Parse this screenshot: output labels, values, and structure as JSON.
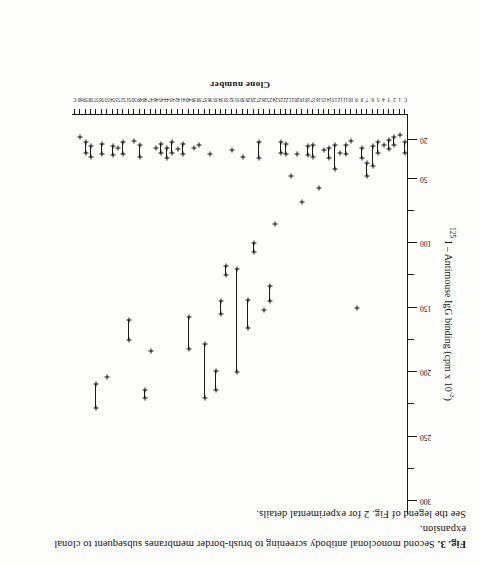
{
  "caption": {
    "fig_number": "Fig. 3.",
    "line1": " Second monoclonal antibody screening to brush-border membranes subsequent to clonal expansion.",
    "line2": "See the legend of Fig. 2 for experimental details."
  },
  "chart_data": {
    "type": "scatter",
    "title": "",
    "xlabel": "Clone  number",
    "ylabel": "125 I – Antimouse IgG binding (cpm x 10-2)",
    "ylabel_prefix": "125",
    "ylabel_main": " I – Antimouse  IgG   binding  (cpm x 10",
    "ylabel_exponent": "-2",
    "ylabel_suffix": ")",
    "ylim": [
      0,
      310
    ],
    "ytick_values": [
      20,
      50,
      100,
      150,
      200,
      250,
      300
    ],
    "ytick_labels": [
      "20",
      "50",
      "100",
      "150",
      "200",
      "250",
      "300"
    ],
    "yminor_values": [
      75,
      125,
      175,
      225,
      275
    ],
    "grid": false,
    "legend": null,
    "xlim": [
      0,
      62
    ],
    "xtick_labels": [
      "C",
      "1",
      "2",
      "3",
      "4",
      "5",
      "6",
      "7",
      "8",
      "9",
      "10",
      "11",
      "12",
      "13",
      "14",
      "15",
      "16",
      "17",
      "18",
      "19",
      "20",
      "21",
      "22",
      "23",
      "24",
      "25",
      "26",
      "27",
      "28",
      "29",
      "30",
      "31",
      "32",
      "33",
      "34",
      "35",
      "36",
      "37",
      "38",
      "39",
      "40",
      "41",
      "42",
      "43",
      "44",
      "45",
      "46",
      "47",
      "48",
      "49",
      "50",
      "51",
      "52",
      "53",
      "54",
      "55",
      "56",
      "57",
      "58",
      "59",
      "60",
      "C"
    ],
    "series_note": "each clone measured in duplicate; the two values are joined by a horizontal line",
    "points": [
      {
        "clone": 1,
        "low": 22,
        "high": 30
      },
      {
        "clone": 2,
        "low": 16,
        "high": 16
      },
      {
        "clone": 3,
        "low": 18,
        "high": 24
      },
      {
        "clone": 4,
        "low": 20,
        "high": 27
      },
      {
        "clone": 5,
        "low": 24,
        "high": 24
      },
      {
        "clone": 6,
        "low": 22,
        "high": 30
      },
      {
        "clone": 7,
        "low": 25,
        "high": 40
      },
      {
        "clone": 8,
        "low": 38,
        "high": 48
      },
      {
        "clone": 9,
        "low": 26,
        "high": 34
      },
      {
        "clone": 10,
        "low": 150,
        "high": 150
      },
      {
        "clone": 11,
        "low": 21,
        "high": 21
      },
      {
        "clone": 12,
        "low": 24,
        "high": 31
      },
      {
        "clone": 13,
        "low": 30,
        "high": 30
      },
      {
        "clone": 14,
        "low": 24,
        "high": 43
      },
      {
        "clone": 15,
        "low": 26,
        "high": 34
      },
      {
        "clone": 16,
        "low": 28,
        "high": 28
      },
      {
        "clone": 17,
        "low": 57,
        "high": 57
      },
      {
        "clone": 18,
        "low": 24,
        "high": 33
      },
      {
        "clone": 19,
        "low": 25,
        "high": 32
      },
      {
        "clone": 20,
        "low": 68,
        "high": 68
      },
      {
        "clone": 21,
        "low": 31,
        "high": 31
      },
      {
        "clone": 22,
        "low": 48,
        "high": 48
      },
      {
        "clone": 23,
        "low": 23,
        "high": 31
      },
      {
        "clone": 24,
        "low": 22,
        "high": 30
      },
      {
        "clone": 25,
        "low": 85,
        "high": 85
      },
      {
        "clone": 26,
        "low": 133,
        "high": 145
      },
      {
        "clone": 27,
        "low": 152,
        "high": 152
      },
      {
        "clone": 28,
        "low": 22,
        "high": 34
      },
      {
        "clone": 29,
        "low": 100,
        "high": 107
      },
      {
        "clone": 30,
        "low": 144,
        "high": 166
      },
      {
        "clone": 31,
        "low": 33,
        "high": 33
      },
      {
        "clone": 32,
        "low": 120,
        "high": 200
      },
      {
        "clone": 33,
        "low": 28,
        "high": 28
      },
      {
        "clone": 34,
        "low": 118,
        "high": 125
      },
      {
        "clone": 35,
        "low": 145,
        "high": 155
      },
      {
        "clone": 36,
        "low": 199,
        "high": 214
      },
      {
        "clone": 37,
        "low": 31,
        "high": 31
      },
      {
        "clone": 38,
        "low": 178,
        "high": 220
      },
      {
        "clone": 39,
        "low": 24,
        "high": 24
      },
      {
        "clone": 40,
        "low": 26,
        "high": 26
      },
      {
        "clone": 41,
        "low": 157,
        "high": 182
      },
      {
        "clone": 42,
        "low": 23,
        "high": 31
      },
      {
        "clone": 43,
        "low": 27,
        "high": 27
      },
      {
        "clone": 44,
        "low": 22,
        "high": 30
      },
      {
        "clone": 45,
        "low": 26,
        "high": 34
      },
      {
        "clone": 46,
        "low": 23,
        "high": 30
      },
      {
        "clone": 47,
        "low": 26,
        "high": 26
      },
      {
        "clone": 48,
        "low": 184,
        "high": 184
      },
      {
        "clone": 49,
        "low": 214,
        "high": 220
      },
      {
        "clone": 50,
        "low": 24,
        "high": 33
      },
      {
        "clone": 51,
        "low": 21,
        "high": 21
      },
      {
        "clone": 52,
        "low": 160,
        "high": 175
      },
      {
        "clone": 53,
        "low": 22,
        "high": 31
      },
      {
        "clone": 54,
        "low": 26,
        "high": 26
      },
      {
        "clone": 55,
        "low": 25,
        "high": 32
      },
      {
        "clone": 56,
        "low": 204,
        "high": 204
      },
      {
        "clone": 57,
        "low": 23,
        "high": 31
      },
      {
        "clone": 58,
        "low": 209,
        "high": 228
      },
      {
        "clone": 59,
        "low": 25,
        "high": 33
      },
      {
        "clone": 60,
        "low": 22,
        "high": 30
      },
      {
        "clone": 61,
        "low": 18,
        "high": 18
      }
    ]
  }
}
